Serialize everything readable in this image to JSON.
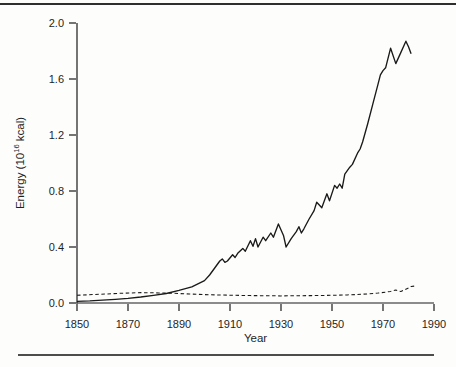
{
  "figure": {
    "background": "#fdfdfc",
    "line_color": "#1a1a1a",
    "text_color": "#1f1f1f",
    "top_rule_color": "#2e2e2e",
    "bottom_rule_color": "#4d4d4d"
  },
  "chart_data": {
    "type": "line",
    "title": "",
    "xlabel": "Year",
    "ylabel": "Energy (10¹⁶ kcal)",
    "ylabel_parts": {
      "prefix": "Energy (10",
      "superscript": "16",
      "suffix": " kcal)"
    },
    "xlim": [
      1850,
      1990
    ],
    "ylim": [
      0,
      2.0
    ],
    "grid": false,
    "legend": "none",
    "xticks": [
      1850,
      1870,
      1890,
      1910,
      1930,
      1950,
      1970,
      1990
    ],
    "yticks": [
      {
        "value": 0.0,
        "label": "0.0"
      },
      {
        "value": 0.4,
        "label": "0.4"
      },
      {
        "value": 0.8,
        "label": "0.8"
      },
      {
        "value": 1.2,
        "label": "1.2"
      },
      {
        "value": 1.6,
        "label": "1.6"
      },
      {
        "value": 2.0,
        "label": "2.0"
      }
    ],
    "series": [
      {
        "name": "solid-line-series",
        "line_style": "solid",
        "points": [
          [
            1850,
            0.012
          ],
          [
            1855,
            0.015
          ],
          [
            1860,
            0.02
          ],
          [
            1865,
            0.026
          ],
          [
            1870,
            0.033
          ],
          [
            1875,
            0.043
          ],
          [
            1880,
            0.055
          ],
          [
            1885,
            0.068
          ],
          [
            1890,
            0.09
          ],
          [
            1895,
            0.115
          ],
          [
            1900,
            0.16
          ],
          [
            1902,
            0.2
          ],
          [
            1904,
            0.25
          ],
          [
            1906,
            0.3
          ],
          [
            1907,
            0.315
          ],
          [
            1908,
            0.29
          ],
          [
            1909,
            0.3
          ],
          [
            1911,
            0.345
          ],
          [
            1912,
            0.325
          ],
          [
            1913,
            0.355
          ],
          [
            1915,
            0.39
          ],
          [
            1916,
            0.37
          ],
          [
            1918,
            0.445
          ],
          [
            1919,
            0.405
          ],
          [
            1920,
            0.46
          ],
          [
            1921,
            0.4
          ],
          [
            1923,
            0.47
          ],
          [
            1924,
            0.445
          ],
          [
            1926,
            0.5
          ],
          [
            1927,
            0.47
          ],
          [
            1929,
            0.565
          ],
          [
            1931,
            0.48
          ],
          [
            1932,
            0.4
          ],
          [
            1934,
            0.46
          ],
          [
            1936,
            0.51
          ],
          [
            1937,
            0.545
          ],
          [
            1938,
            0.5
          ],
          [
            1939,
            0.53
          ],
          [
            1941,
            0.6
          ],
          [
            1943,
            0.66
          ],
          [
            1944,
            0.72
          ],
          [
            1945,
            0.7
          ],
          [
            1946,
            0.68
          ],
          [
            1948,
            0.78
          ],
          [
            1949,
            0.73
          ],
          [
            1951,
            0.84
          ],
          [
            1952,
            0.82
          ],
          [
            1953,
            0.85
          ],
          [
            1954,
            0.82
          ],
          [
            1955,
            0.92
          ],
          [
            1957,
            0.97
          ],
          [
            1958,
            0.99
          ],
          [
            1960,
            1.07
          ],
          [
            1961,
            1.1
          ],
          [
            1962,
            1.15
          ],
          [
            1964,
            1.28
          ],
          [
            1966,
            1.42
          ],
          [
            1968,
            1.56
          ],
          [
            1969,
            1.63
          ],
          [
            1970,
            1.66
          ],
          [
            1971,
            1.68
          ],
          [
            1973,
            1.82
          ],
          [
            1975,
            1.71
          ],
          [
            1977,
            1.79
          ],
          [
            1979,
            1.87
          ],
          [
            1980,
            1.83
          ],
          [
            1981,
            1.78
          ]
        ]
      },
      {
        "name": "dashed-line-series",
        "line_style": "dashed",
        "points": [
          [
            1850,
            0.055
          ],
          [
            1856,
            0.06
          ],
          [
            1862,
            0.065
          ],
          [
            1868,
            0.07
          ],
          [
            1875,
            0.074
          ],
          [
            1882,
            0.072
          ],
          [
            1888,
            0.069
          ],
          [
            1894,
            0.064
          ],
          [
            1900,
            0.06
          ],
          [
            1906,
            0.057
          ],
          [
            1912,
            0.055
          ],
          [
            1918,
            0.053
          ],
          [
            1924,
            0.052
          ],
          [
            1930,
            0.051
          ],
          [
            1936,
            0.052
          ],
          [
            1942,
            0.053
          ],
          [
            1948,
            0.054
          ],
          [
            1952,
            0.056
          ],
          [
            1956,
            0.058
          ],
          [
            1960,
            0.061
          ],
          [
            1964,
            0.065
          ],
          [
            1968,
            0.071
          ],
          [
            1971,
            0.077
          ],
          [
            1973,
            0.083
          ],
          [
            1975,
            0.092
          ],
          [
            1976,
            0.086
          ],
          [
            1977,
            0.082
          ],
          [
            1978,
            0.09
          ],
          [
            1980,
            0.108
          ],
          [
            1981,
            0.118
          ],
          [
            1983,
            0.122
          ]
        ]
      }
    ]
  }
}
